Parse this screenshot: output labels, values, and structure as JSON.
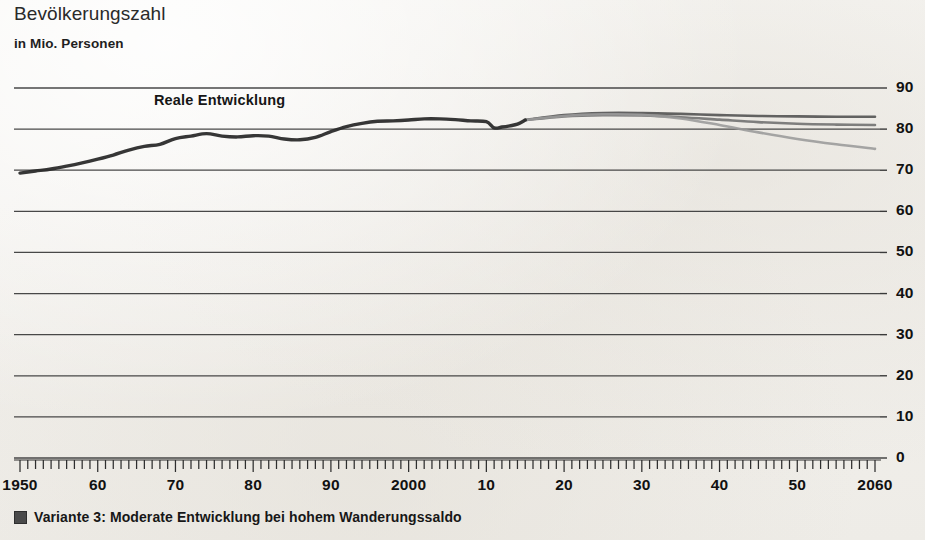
{
  "header": {
    "title": "Bevölkerungszahl",
    "subtitle": "in Mio. Personen"
  },
  "annotation": {
    "real_development": "Reale Entwicklung"
  },
  "legend": {
    "swatch_color": "#4a4a4a",
    "items": [
      {
        "marker": "square-marker",
        "label": "Variante 3: Moderate Entwicklung bei hohem Wanderungssaldo"
      }
    ]
  },
  "colors": {
    "background": "#f4f2ef",
    "gridline": "#3a3a3a",
    "history_line": "#2b2b2b",
    "variant_1": "#4f4f4f",
    "variant_2": "#6e6e6e",
    "variant_3": "#9a9a9a",
    "text": "#1b1b1b"
  },
  "chart_data": {
    "type": "line",
    "title": "Bevölkerungszahl",
    "subtitle": "in Mio. Personen",
    "xlabel": "",
    "ylabel": "in Mio. Personen",
    "xlim": [
      1950,
      2060
    ],
    "ylim": [
      0,
      90
    ],
    "grid": true,
    "legend_position": "bottom-left",
    "y_ticks": [
      0,
      10,
      20,
      30,
      40,
      50,
      60,
      70,
      80,
      90
    ],
    "y_tick_labels": [
      "0",
      "10",
      "20",
      "30",
      "40",
      "50",
      "60",
      "70",
      "80",
      "90"
    ],
    "x_ticks": [
      1950,
      1960,
      1970,
      1980,
      1990,
      2000,
      2010,
      2020,
      2030,
      2040,
      2050,
      2060
    ],
    "x_tick_labels": [
      "1950",
      "60",
      "70",
      "80",
      "90",
      "2000",
      "10",
      "20",
      "30",
      "40",
      "50",
      "2060"
    ],
    "x_minor_tick_interval": 1,
    "annotations": [
      {
        "text": "Reale Entwicklung",
        "x": 1968,
        "y": 86.5
      }
    ],
    "series": [
      {
        "name": "Reale Entwicklung",
        "kind": "history",
        "color": "#2b2b2b",
        "width": 3.4,
        "x": [
          1950,
          1952,
          1954,
          1956,
          1958,
          1960,
          1962,
          1964,
          1966,
          1968,
          1970,
          1972,
          1974,
          1976,
          1978,
          1980,
          1982,
          1984,
          1986,
          1988,
          1990,
          1992,
          1994,
          1996,
          1998,
          2000,
          2002,
          2004,
          2006,
          2008,
          2010,
          2011,
          2012,
          2013,
          2014,
          2015
        ],
        "values": [
          69.3,
          69.8,
          70.3,
          71.0,
          71.8,
          72.7,
          73.7,
          74.9,
          75.8,
          76.3,
          77.7,
          78.3,
          78.9,
          78.3,
          78.1,
          78.4,
          78.3,
          77.6,
          77.4,
          78.0,
          79.4,
          80.6,
          81.4,
          81.9,
          82.0,
          82.2,
          82.5,
          82.5,
          82.3,
          82.0,
          81.8,
          80.3,
          80.5,
          80.8,
          81.2,
          82.2
        ]
      },
      {
        "name": "Variante 1",
        "kind": "projection",
        "color": "#4f4f4f",
        "width": 2.6,
        "x": [
          2015,
          2020,
          2025,
          2030,
          2035,
          2040,
          2045,
          2050,
          2055,
          2060
        ],
        "values": [
          82.2,
          83.4,
          83.9,
          83.9,
          83.7,
          83.4,
          83.2,
          83.1,
          83.0,
          83.0
        ]
      },
      {
        "name": "Variante 2",
        "kind": "projection",
        "color": "#6e6e6e",
        "width": 2.6,
        "x": [
          2015,
          2020,
          2025,
          2030,
          2035,
          2040,
          2045,
          2050,
          2055,
          2060
        ],
        "values": [
          82.2,
          83.1,
          83.4,
          83.3,
          82.9,
          82.3,
          81.7,
          81.3,
          81.1,
          81.0
        ]
      },
      {
        "name": "Variante 3: Moderate Entwicklung bei hohem Wanderungssaldo",
        "kind": "projection",
        "color": "#9a9a9a",
        "width": 2.6,
        "x": [
          2015,
          2020,
          2025,
          2030,
          2035,
          2040,
          2045,
          2050,
          2055,
          2060
        ],
        "values": [
          82.2,
          83.2,
          83.6,
          83.5,
          82.6,
          81.0,
          79.2,
          77.6,
          76.3,
          75.2
        ]
      }
    ]
  }
}
